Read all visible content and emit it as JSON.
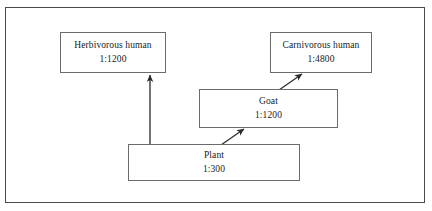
{
  "diagram": {
    "type": "energy-pyramid-flow",
    "title": "",
    "border_color": "#4a4a4a",
    "box_border_color": "#6b6b6b",
    "text_color": "#1a1a1a",
    "background": "#ffffff",
    "nodes": [
      {
        "id": "herbivorous-human",
        "label": "Herbivorous human",
        "ratio": "1:1200",
        "x": 60,
        "y": 32,
        "width": 106,
        "height": 41
      },
      {
        "id": "carnivorous-human",
        "label": "Carnivorous human",
        "ratio": "1:4800",
        "x": 270,
        "y": 32,
        "width": 102,
        "height": 41
      },
      {
        "id": "goat",
        "label": "Goat",
        "ratio": "1:1200",
        "x": 199,
        "y": 89,
        "width": 139,
        "height": 39
      },
      {
        "id": "plant",
        "label": "Plant",
        "ratio": "1:300",
        "x": 128,
        "y": 144,
        "width": 172,
        "height": 37
      }
    ],
    "arrows": [
      {
        "id": "plant-to-herbivorous-human",
        "from": "plant",
        "to": "herbivorous-human",
        "x1": 150,
        "y1": 144,
        "x2": 150,
        "y2": 75
      },
      {
        "id": "plant-to-goat",
        "from": "plant",
        "to": "goat",
        "x1": 221,
        "y1": 145,
        "x2": 244,
        "y2": 129
      },
      {
        "id": "goat-to-carnivorous-human",
        "from": "goat",
        "to": "carnivorous-human",
        "x1": 279,
        "y1": 90,
        "x2": 302,
        "y2": 74
      }
    ]
  }
}
